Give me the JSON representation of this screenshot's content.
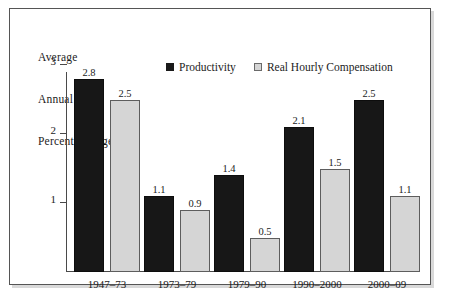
{
  "chart_data": {
    "type": "bar",
    "title": "",
    "ylabel": "Average Annual Percent Change",
    "ylabel_lines": [
      "Average",
      "Annual",
      "Percent Change"
    ],
    "xlabel": "",
    "categories": [
      "1947–73",
      "1973–79",
      "1979–90",
      "1990–2000",
      "2000–09"
    ],
    "series": [
      {
        "name": "Productivity",
        "values": [
          2.8,
          1.1,
          1.4,
          2.1,
          2.5
        ],
        "color": "#171717"
      },
      {
        "name": "Real Hourly Compensation",
        "values": [
          2.5,
          0.9,
          0.5,
          1.5,
          1.1
        ],
        "color": "#d5d5d5"
      }
    ],
    "ylim": [
      0,
      3.3
    ],
    "yticks": [
      1,
      2,
      3
    ],
    "ytick_labels": [
      "1",
      "2",
      "3"
    ],
    "grid": false,
    "legend_position": "top-center",
    "data_labels": true
  },
  "legend": {
    "entries": [
      {
        "label": "Productivity",
        "swatch": "dark-square-icon"
      },
      {
        "label": "Real Hourly Compensation",
        "swatch": "light-square-icon"
      }
    ]
  },
  "colors": {
    "productivity": "#171717",
    "real_hourly_compensation": "#d5d5d5",
    "axis": "#4a4a4a",
    "frame": "#555555",
    "text": "#1c1c1c",
    "background": "#ffffff"
  }
}
